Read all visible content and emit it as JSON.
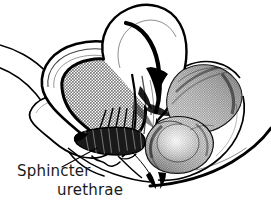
{
  "figure": {
    "title": "Sphincter urethrae",
    "type": "anatomical-line-illustration",
    "style": "pen-and-ink halftone medical illustration",
    "background_color": "#ffffff",
    "ink_color": "#000000",
    "halftone_gray": "#9a9a9a",
    "shade_light": "#c9c9c9",
    "shade_mid": "#8e8e8e",
    "shade_dark": "#4a4a4a",
    "width": 271,
    "height": 204
  },
  "labels": [
    {
      "id": "sphincter-urethrae",
      "line1": "Sphincter",
      "line2": "urethrae",
      "line1_x": 17,
      "line1_y": 176,
      "line2_x": 57,
      "line2_y": 195,
      "leader_from_x": 62,
      "leader_from_y": 167,
      "leader_to_x": 97,
      "leader_to_y": 148
    }
  ],
  "structures": [
    {
      "id": "bladder-lumen",
      "name": "bladder cavity",
      "fill": "halftone"
    },
    {
      "id": "bladder-wall",
      "name": "bladder wall",
      "fill": "white"
    },
    {
      "id": "upper-hook",
      "name": "superior recess loop",
      "fill": "white"
    },
    {
      "id": "left-loop",
      "name": "anterior nested loop",
      "fill": "white"
    },
    {
      "id": "outer-contour",
      "name": "pelvic outline arcs",
      "fill": "none"
    },
    {
      "id": "sphincter-band",
      "name": "sphincter urethrae striated band",
      "fill": "dark"
    },
    {
      "id": "right-upper-mass",
      "name": "posterior superior mass",
      "fill": "shaded"
    },
    {
      "id": "right-lower-mass",
      "name": "posterior inferior bulb",
      "fill": "shaded"
    },
    {
      "id": "midline-wedge",
      "name": "midline dark wedge",
      "fill": "black"
    }
  ]
}
